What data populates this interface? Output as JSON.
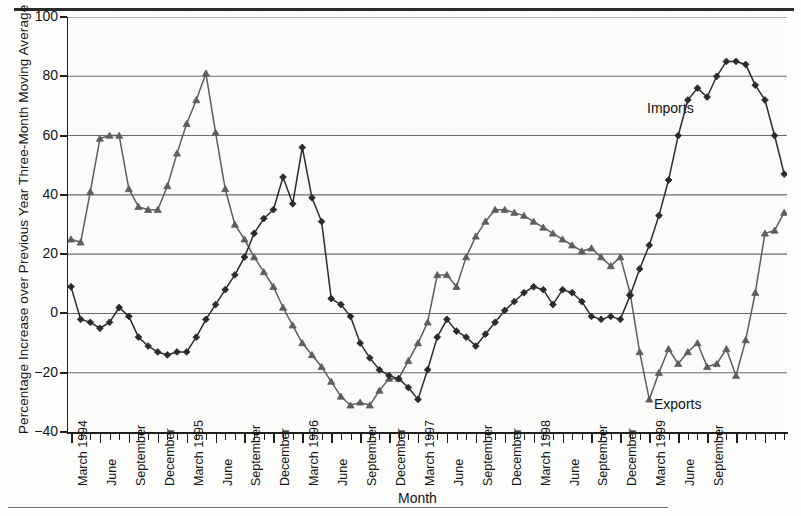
{
  "figure": {
    "title": "",
    "x_axis_title": "Month",
    "y_axis_title": "Percentage Increase over Previous Year Three-Month Moving Average",
    "imports_tag": "Imports",
    "exports_tag": "Exports",
    "colors": {
      "imports": "#2b2b2b",
      "exports": "#5d5d5d",
      "grid": "#6a6a6a",
      "axis": "#1f1f1f",
      "background": "#fbfbfa"
    }
  },
  "chart_data": {
    "type": "line",
    "title": "",
    "xlabel": "Month",
    "ylabel": "Percentage Increase over Previous Year Three-Month Moving Average",
    "ylim": [
      -40,
      100
    ],
    "yticks": [
      -40,
      -20,
      0,
      20,
      40,
      60,
      80,
      100
    ],
    "ytick_labels": [
      "−40",
      "−20",
      "0",
      "20",
      "40",
      "60",
      "80",
      "100"
    ],
    "grid": true,
    "legend": "inline-annotation",
    "x_tick_interval": "monthly",
    "x_labeled_ticks": [
      "March 1994",
      "June",
      "September",
      "December",
      "March 1995",
      "June",
      "September",
      "December",
      "March 1996",
      "June",
      "September",
      "December",
      "March 1997",
      "June",
      "September",
      "December",
      "March 1998",
      "June",
      "September",
      "December",
      "March 1999",
      "June",
      "September"
    ],
    "x": [
      "March 1994",
      "April 1994",
      "May 1994",
      "June 1994",
      "July 1994",
      "August 1994",
      "September 1994",
      "October 1994",
      "November 1994",
      "December 1994",
      "January 1995",
      "February 1995",
      "March 1995",
      "April 1995",
      "May 1995",
      "June 1995",
      "July 1995",
      "August 1995",
      "September 1995",
      "October 1995",
      "November 1995",
      "December 1995",
      "January 1996",
      "February 1996",
      "March 1996",
      "April 1996",
      "May 1996",
      "June 1996",
      "July 1996",
      "August 1996",
      "September 1996",
      "October 1996",
      "November 1996",
      "December 1996",
      "January 1997",
      "February 1997",
      "March 1997",
      "April 1997",
      "May 1997",
      "June 1997",
      "July 1997",
      "August 1997",
      "September 1997",
      "October 1997",
      "November 1997",
      "December 1997",
      "January 1998",
      "February 1998",
      "March 1998",
      "April 1998",
      "May 1998",
      "June 1998",
      "July 1998",
      "August 1998",
      "September 1998",
      "October 1998",
      "November 1998",
      "December 1998",
      "January 1999",
      "February 1999",
      "March 1999",
      "April 1999",
      "May 1999",
      "June 1999",
      "July 1999",
      "August 1999",
      "September 1999",
      "October 1999",
      "November 1999"
    ],
    "series": [
      {
        "name": "Imports",
        "marker": "diamond",
        "color": "#2b2b2b",
        "values": [
          9,
          -2,
          -3,
          -5,
          -3,
          2,
          -1,
          -8,
          -11,
          -13,
          -14,
          -13,
          -13,
          -8,
          -2,
          3,
          8,
          13,
          19,
          27,
          32,
          35,
          46,
          37,
          56,
          39,
          31,
          5,
          3,
          -1,
          -10,
          -15,
          -19,
          -21,
          -22,
          -25,
          -29,
          -19,
          -8,
          -2,
          -6,
          -8,
          -11,
          -7,
          -3,
          1,
          4,
          7,
          9,
          8,
          3,
          8,
          7,
          4,
          -1,
          -2,
          -1,
          -2,
          6,
          15,
          23,
          33,
          45,
          60,
          72,
          76,
          73,
          80,
          85
        ]
      },
      {
        "name": "Exports",
        "marker": "triangle",
        "color": "#5d5d5d",
        "values": [
          25,
          24,
          41,
          59,
          60,
          60,
          42,
          36,
          35,
          35,
          43,
          54,
          64,
          72,
          81,
          61,
          42,
          30,
          25,
          19,
          14,
          9,
          2,
          -4,
          -10,
          -14,
          -18,
          -23,
          -28,
          -31,
          -30,
          -31,
          -26,
          -22,
          -22,
          -16,
          -10,
          -3,
          13,
          13,
          9,
          19,
          26,
          31,
          35,
          35,
          34,
          33,
          31,
          29,
          27,
          25,
          23,
          21,
          22,
          19,
          16,
          19,
          7,
          -13,
          -29,
          -20,
          -12,
          -17,
          -13,
          -10,
          -18,
          -17,
          -12
        ]
      }
    ],
    "series_tail": {
      "note": "series continue to the right edge",
      "Imports": [
        85,
        84,
        77,
        72,
        60,
        47
      ],
      "Exports": [
        -21,
        -9,
        7,
        27,
        28,
        34
      ]
    }
  }
}
